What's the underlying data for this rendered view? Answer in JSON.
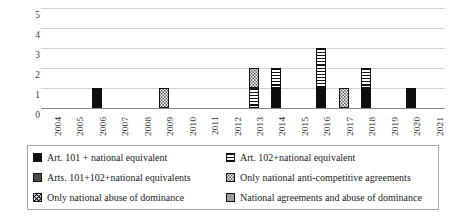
{
  "chart_data": {
    "type": "bar",
    "subtype": "stacked-bar",
    "title": "",
    "xlabel": "",
    "ylabel": "",
    "ylim": [
      0,
      5
    ],
    "y_ticks": [
      "0",
      "1",
      "2",
      "3",
      "4",
      "5"
    ],
    "grid": true,
    "legend_position": "bottom",
    "categories": [
      "2004",
      "2005",
      "2006",
      "2007",
      "2008",
      "2009",
      "2010",
      "2011",
      "2012",
      "2013",
      "2014",
      "2015",
      "2016",
      "2017",
      "2018",
      "2019",
      "2020",
      "2021"
    ],
    "series": [
      {
        "name": "Art. 101 + national equivalent",
        "pattern": "solid-black",
        "color": "#0d0d0d",
        "values": [
          0,
          0,
          1,
          0,
          0,
          0,
          0,
          0,
          0,
          0,
          1,
          0,
          1,
          0,
          1,
          0,
          1,
          0
        ]
      },
      {
        "name": "Art. 102+national equivalent",
        "pattern": "horizontal-stripes",
        "color": "#111111",
        "values": [
          0,
          0,
          0,
          0,
          0,
          0,
          0,
          0,
          0,
          1,
          1,
          0,
          2,
          0,
          1,
          0,
          0,
          0
        ]
      },
      {
        "name": "Arts. 101+102+national equivalents",
        "pattern": "solid-dark-gray",
        "color": "#4a4a4a",
        "values": [
          0,
          0,
          0,
          0,
          0,
          0,
          0,
          0,
          0,
          0,
          0,
          0,
          0,
          0,
          0,
          0,
          0,
          0
        ]
      },
      {
        "name": "Only national anti-competitive agreements",
        "pattern": "dotted-light",
        "color": "#5a5a5a",
        "values": [
          0,
          0,
          0,
          0,
          0,
          1,
          0,
          0,
          0,
          1,
          0,
          0,
          0,
          1,
          0,
          0,
          0,
          0
        ]
      },
      {
        "name": "Only national abuse of dominance",
        "pattern": "dotted-on-black",
        "color": "#111111",
        "values": [
          0,
          0,
          0,
          0,
          0,
          0,
          0,
          0,
          0,
          0,
          0,
          0,
          0,
          0,
          0,
          0,
          0,
          0
        ]
      },
      {
        "name": "National agreements  and abuse of dominance",
        "pattern": "solid-gray",
        "color": "#9b9b9b",
        "values": [
          0,
          0,
          0,
          0,
          0,
          0,
          0,
          0,
          0,
          0,
          0,
          0,
          0,
          0,
          0,
          0,
          0,
          0
        ]
      }
    ],
    "totals": [
      0,
      0,
      1,
      0,
      0,
      1,
      0,
      0,
      0,
      2,
      2,
      0,
      3,
      1,
      2,
      0,
      1,
      0
    ]
  },
  "axes": {
    "y_ticks": [
      {
        "label": "5"
      },
      {
        "label": "4"
      },
      {
        "label": "3"
      },
      {
        "label": "2"
      },
      {
        "label": "1"
      },
      {
        "label": "0"
      }
    ],
    "x_ticks": [
      {
        "label": "2004"
      },
      {
        "label": "2005"
      },
      {
        "label": "2006"
      },
      {
        "label": "2007"
      },
      {
        "label": "2008"
      },
      {
        "label": "2009"
      },
      {
        "label": "2010"
      },
      {
        "label": "2011"
      },
      {
        "label": "2012"
      },
      {
        "label": "2013"
      },
      {
        "label": "2014"
      },
      {
        "label": "2015"
      },
      {
        "label": "2016"
      },
      {
        "label": "2017"
      },
      {
        "label": "2018"
      },
      {
        "label": "2019"
      },
      {
        "label": "2020"
      },
      {
        "label": "2021"
      }
    ]
  },
  "bars": [
    {
      "year": "2004",
      "segments": []
    },
    {
      "year": "2005",
      "segments": []
    },
    {
      "year": "2006",
      "segments": [
        {
          "series": "Art. 101 + national equivalent",
          "value": 1,
          "fill": "fill-black"
        }
      ]
    },
    {
      "year": "2007",
      "segments": []
    },
    {
      "year": "2008",
      "segments": []
    },
    {
      "year": "2009",
      "segments": [
        {
          "series": "Only national anti-competitive agreements",
          "value": 1,
          "fill": "fill-dots"
        }
      ]
    },
    {
      "year": "2010",
      "segments": []
    },
    {
      "year": "2011",
      "segments": []
    },
    {
      "year": "2012",
      "segments": []
    },
    {
      "year": "2013",
      "segments": [
        {
          "series": "Art. 102+national equivalent",
          "value": 1,
          "fill": "fill-hstripe"
        },
        {
          "series": "Only national anti-competitive agreements",
          "value": 1,
          "fill": "fill-dots"
        }
      ]
    },
    {
      "year": "2014",
      "segments": [
        {
          "series": "Art. 101 + national equivalent",
          "value": 1,
          "fill": "fill-black"
        },
        {
          "series": "Art. 102+national equivalent",
          "value": 1,
          "fill": "fill-hstripe"
        }
      ]
    },
    {
      "year": "2015",
      "segments": []
    },
    {
      "year": "2016",
      "segments": [
        {
          "series": "Art. 101 + national equivalent",
          "value": 1,
          "fill": "fill-black"
        },
        {
          "series": "Art. 102+national equivalent",
          "value": 2,
          "fill": "fill-hstripe"
        }
      ]
    },
    {
      "year": "2017",
      "segments": [
        {
          "series": "Only national anti-competitive agreements",
          "value": 1,
          "fill": "fill-dots"
        }
      ]
    },
    {
      "year": "2018",
      "segments": [
        {
          "series": "Art. 101 + national equivalent",
          "value": 1,
          "fill": "fill-black"
        },
        {
          "series": "Art. 102+national equivalent",
          "value": 1,
          "fill": "fill-hstripe"
        }
      ]
    },
    {
      "year": "2019",
      "segments": []
    },
    {
      "year": "2020",
      "segments": [
        {
          "series": "Art. 101 + national equivalent",
          "value": 1,
          "fill": "fill-black"
        }
      ]
    },
    {
      "year": "2021",
      "segments": []
    }
  ],
  "legend": {
    "items": [
      {
        "label": "Art. 101 + national equivalent",
        "fill": "fill-black",
        "icon": "legend-swatch-solid-black"
      },
      {
        "label": "Art. 102+national equivalent",
        "fill": "fill-hstripe",
        "icon": "legend-swatch-horizontal-stripes"
      },
      {
        "label": "Arts. 101+102+national equivalents",
        "fill": "fill-darkgray",
        "icon": "legend-swatch-dark-gray"
      },
      {
        "label": "Only national anti-competitive agreements",
        "fill": "fill-dots",
        "icon": "legend-swatch-dotted"
      },
      {
        "label": "Only national abuse of dominance",
        "fill": "fill-dotblack",
        "icon": "legend-swatch-dotted-black"
      },
      {
        "label": "National agreements  and abuse of dominance",
        "fill": "fill-gray",
        "icon": "legend-swatch-gray"
      }
    ]
  }
}
